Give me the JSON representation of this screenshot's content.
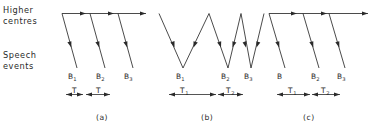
{
  "figure": {
    "width": 374,
    "height": 128,
    "background_color": "#ffffff",
    "line_color": "#2a2a2a",
    "axis_labels": {
      "top_line1": "Higher",
      "top_line2": "centres",
      "bottom_line1": "Speech",
      "bottom_line2": "events"
    },
    "panels": [
      {
        "id": "a",
        "caption": "(a)",
        "type": "sawtooth-uniform",
        "vertex_labels": [
          {
            "base": "B",
            "sub": "1"
          },
          {
            "base": "B",
            "sub": "2"
          },
          {
            "base": "B",
            "sub": "3"
          }
        ],
        "intervals": [
          {
            "base": "T",
            "sub": ""
          },
          {
            "base": "T",
            "sub": ""
          }
        ]
      },
      {
        "id": "b",
        "caption": "(b)",
        "type": "zigzag",
        "vertex_labels": [
          {
            "base": "B",
            "sub": "1"
          },
          {
            "base": "B",
            "sub": "2"
          },
          {
            "base": "B",
            "sub": "3"
          }
        ],
        "intervals": [
          {
            "base": "T",
            "sub": "1"
          },
          {
            "base": "T",
            "sub": "2"
          }
        ]
      },
      {
        "id": "c",
        "caption": "(c)",
        "type": "sawtooth-nonuniform",
        "vertex_labels": [
          {
            "base": "B",
            "sub": ""
          },
          {
            "base": "B",
            "sub": "2"
          },
          {
            "base": "B",
            "sub": "3"
          }
        ],
        "intervals": [
          {
            "base": "T",
            "sub": "1"
          },
          {
            "base": "T",
            "sub": "2"
          }
        ]
      }
    ]
  }
}
